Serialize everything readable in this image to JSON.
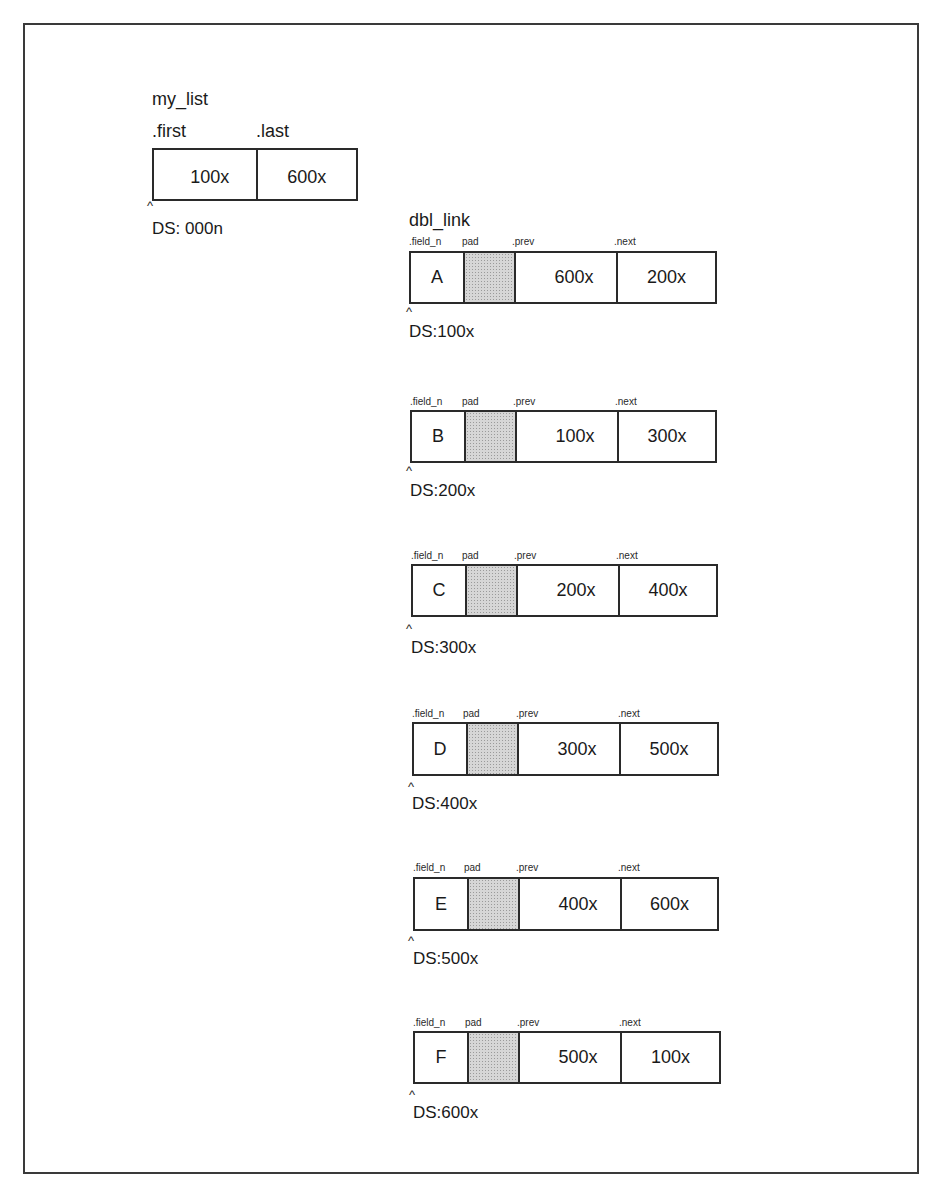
{
  "my_list": {
    "title": "my_list",
    "fields": [
      {
        "label": ".first",
        "value": "100x"
      },
      {
        "label": ".last",
        "value": "600x"
      }
    ],
    "caret": "^",
    "ds_label": "DS: 000n"
  },
  "dbl_link": {
    "title": "dbl_link",
    "field_labels": {
      "field_n": ".field_n",
      "pad": "pad",
      "prev": ".prev",
      "next": ".next"
    },
    "caret": "^",
    "nodes": [
      {
        "field_n": "A",
        "prev": "600x",
        "next": "200x",
        "ds_label": "DS:100x"
      },
      {
        "field_n": "B",
        "prev": "100x",
        "next": "300x",
        "ds_label": "DS:200x"
      },
      {
        "field_n": "C",
        "prev": "200x",
        "next": "400x",
        "ds_label": "DS:300x"
      },
      {
        "field_n": "D",
        "prev": "300x",
        "next": "500x",
        "ds_label": "DS:400x"
      },
      {
        "field_n": "E",
        "prev": "400x",
        "next": "600x",
        "ds_label": "DS:500x"
      },
      {
        "field_n": "F",
        "prev": "500x",
        "next": "100x",
        "ds_label": "DS:600x"
      }
    ]
  },
  "colors": {
    "line": "#2a2a2a",
    "pad_fill": "#d6d6d6",
    "background": "#ffffff"
  }
}
